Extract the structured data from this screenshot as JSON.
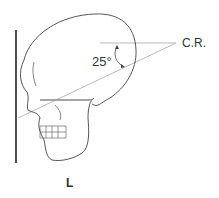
{
  "figure": {
    "central_ray_label": "C.R.",
    "angle_label": "25°",
    "side_marker": "L"
  },
  "colors": {
    "outline": "#444444",
    "ray": "#bbbbbb",
    "ir": "#222222"
  }
}
